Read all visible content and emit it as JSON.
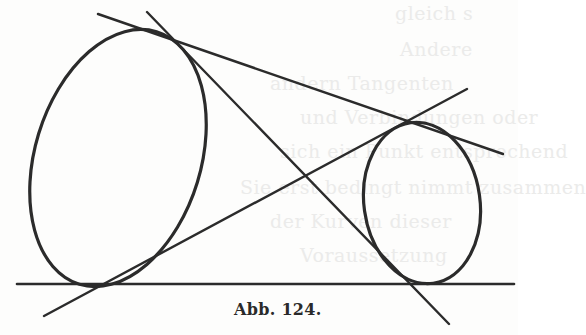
{
  "figure": {
    "caption": "Abb. 124.",
    "ink_color": "#2b2b2b",
    "background": "#fdfdfc",
    "shapes": {
      "large_ellipse": {
        "cx": 118,
        "cy": 158,
        "rx": 83,
        "ry": 132,
        "rotation_deg": 17
      },
      "small_ellipse": {
        "cx": 422,
        "cy": 203,
        "rx": 58,
        "ry": 81,
        "rotation_deg": -8
      },
      "lines": [
        {
          "id": "upper-tangent",
          "x1": 98,
          "y1": 14,
          "x2": 503,
          "y2": 154
        },
        {
          "id": "steep-cross-tangent",
          "x1": 147,
          "y1": 12,
          "x2": 449,
          "y2": 324
        },
        {
          "id": "rising-cross-tangent",
          "x1": 44,
          "y1": 316,
          "x2": 467,
          "y2": 89
        },
        {
          "id": "base-tangent",
          "x1": 17,
          "y1": 284,
          "x2": 514,
          "y2": 284
        }
      ]
    }
  },
  "bleed_through_text": [
    {
      "text": "gleich s",
      "x": 395,
      "y": 2
    },
    {
      "text": "Andere",
      "x": 400,
      "y": 38
    },
    {
      "text": "andern Tangenten",
      "x": 270,
      "y": 72
    },
    {
      "text": "und Verbindungen oder",
      "x": 300,
      "y": 106
    },
    {
      "text": "sich ein Punkt entsprechend",
      "x": 280,
      "y": 140
    },
    {
      "text": "Sie erst bedingt nimmt zusammen",
      "x": 240,
      "y": 176
    },
    {
      "text": "der Kurven dieser",
      "x": 270,
      "y": 210
    },
    {
      "text": "Voraussetzung",
      "x": 300,
      "y": 244
    }
  ]
}
